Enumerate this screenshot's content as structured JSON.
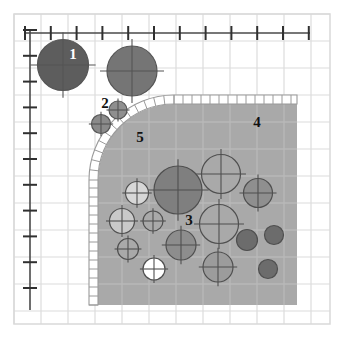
{
  "figure": {
    "name": "grain-packing-diagram",
    "width": 344,
    "height": 338,
    "background_color": "#ffffff"
  },
  "colors": {
    "background": "#ffffff",
    "frame_border": "#d9d9d9",
    "grid_line": "#e8e8e8",
    "grid_line_major": "#dcdcdc",
    "axis_line": "#4a4a4a",
    "tick_mark": "#303030",
    "shaded_region_fill": "#a9a9a9",
    "shaded_region_grid": "#b8b8b8",
    "hatch_band_fill": "#ffffff",
    "hatch_band_stroke": "#9a9a9a",
    "circle_dark": "#5d5d5d",
    "circle_mid_dark": "#7c7c7c",
    "circle_mid": "#8f8f8f",
    "circle_light": "#bdbdbd",
    "circle_pale": "#d7d7d7",
    "circle_white": "#ffffff",
    "circle_stroke": "#555555",
    "label_dark": "#111111",
    "label_light": "#ffffff"
  },
  "frame": {
    "x": 14,
    "y": 14,
    "width": 316,
    "height": 310
  },
  "grid": {
    "cell_size": 27,
    "origin_x": 14,
    "origin_y": 14,
    "visible": true
  },
  "axes": {
    "x_axis": {
      "name": "x-axis",
      "x1": 25,
      "y1": 33,
      "x2": 310,
      "y2": 33,
      "tick_count": 12,
      "tick_spacing": 25.8,
      "tick_length": 7,
      "tick_labels": []
    },
    "y_axis": {
      "name": "y-axis",
      "x1": 30,
      "y1": 30,
      "x2": 30,
      "y2": 310,
      "tick_count": 11,
      "tick_spacing": 25.8,
      "tick_length": 7,
      "tick_labels": []
    }
  },
  "region": {
    "name": "shaded-packed-region",
    "left": 98,
    "top": 104,
    "right": 297,
    "bottom": 305,
    "corner_radius": 76,
    "fill": "#a9a9a9"
  },
  "hatch_band": {
    "name": "hatched-boundary-band",
    "thickness": 9,
    "rung_spacing": 9,
    "description": "ladder-hatched band tracing the top edge and the rounded left corner down the left side"
  },
  "labels": [
    {
      "id": "1",
      "text": "1",
      "x": 73,
      "y": 59,
      "color": "#ffffff",
      "size": 15
    },
    {
      "id": "2",
      "text": "2",
      "x": 105,
      "y": 108,
      "color": "#111111",
      "size": 15
    },
    {
      "id": "3",
      "text": "3",
      "x": 189,
      "y": 225,
      "color": "#111111",
      "size": 15
    },
    {
      "id": "4",
      "text": "4",
      "x": 257,
      "y": 127,
      "color": "#111111",
      "size": 15
    },
    {
      "id": "5",
      "text": "5",
      "x": 140,
      "y": 142,
      "color": "#111111",
      "size": 15
    }
  ],
  "circles": [
    {
      "name": "grain-outside-1",
      "cx": 63,
      "cy": 65,
      "r": 25.5,
      "fill": "#5d5d5d",
      "cross": true,
      "stroke": "#555555"
    },
    {
      "name": "grain-outside-2",
      "cx": 132,
      "cy": 71,
      "r": 25.0,
      "fill": "#757575",
      "cross": true,
      "stroke": "#555555"
    },
    {
      "name": "grain-outside-3",
      "cx": 118,
      "cy": 110,
      "r": 9.0,
      "fill": "#8f8f8f",
      "cross": true,
      "stroke": "#555555"
    },
    {
      "name": "grain-outside-4",
      "cx": 101,
      "cy": 124,
      "r": 9.5,
      "fill": "#8a8a8a",
      "cross": true,
      "stroke": "#555555"
    },
    {
      "name": "grain-inside-1",
      "cx": 178,
      "cy": 190,
      "r": 24.0,
      "fill": "#7f7f7f",
      "cross": true,
      "stroke": "#4f4f4f"
    },
    {
      "name": "grain-inside-2",
      "cx": 221,
      "cy": 174,
      "r": 19.5,
      "fill": "#a9a9a9",
      "cross": true,
      "stroke": "#4f4f4f"
    },
    {
      "name": "grain-inside-3",
      "cx": 258,
      "cy": 193,
      "r": 14.5,
      "fill": "#8f8f8f",
      "cross": true,
      "stroke": "#4f4f4f"
    },
    {
      "name": "grain-inside-4",
      "cx": 219,
      "cy": 224,
      "r": 19.5,
      "fill": "#a9a9a9",
      "cross": true,
      "stroke": "#4f4f4f"
    },
    {
      "name": "grain-inside-5",
      "cx": 137,
      "cy": 193,
      "r": 11.5,
      "fill": "#d7d7d7",
      "cross": true,
      "stroke": "#4f4f4f"
    },
    {
      "name": "grain-inside-6",
      "cx": 122,
      "cy": 221,
      "r": 12.5,
      "fill": "#c9c9c9",
      "cross": true,
      "stroke": "#4f4f4f"
    },
    {
      "name": "grain-inside-7",
      "cx": 153,
      "cy": 221,
      "r": 10.0,
      "fill": "#a9a9a9",
      "cross": true,
      "stroke": "#4f4f4f"
    },
    {
      "name": "grain-inside-8",
      "cx": 128,
      "cy": 249,
      "r": 10.5,
      "fill": "#a9a9a9",
      "cross": true,
      "stroke": "#4f4f4f"
    },
    {
      "name": "grain-inside-9",
      "cx": 181,
      "cy": 245,
      "r": 15.0,
      "fill": "#8d8d8d",
      "cross": true,
      "stroke": "#4f4f4f"
    },
    {
      "name": "grain-inside-10",
      "cx": 154,
      "cy": 269,
      "r": 11.0,
      "fill": "#ffffff",
      "cross": true,
      "stroke": "#4f4f4f"
    },
    {
      "name": "grain-inside-11",
      "cx": 218,
      "cy": 267,
      "r": 15.0,
      "fill": "#9c9c9c",
      "cross": true,
      "stroke": "#4f4f4f"
    },
    {
      "name": "grain-inside-12",
      "cx": 247,
      "cy": 240,
      "r": 10.5,
      "fill": "#6c6c6c",
      "cross": false,
      "stroke": "#4f4f4f"
    },
    {
      "name": "grain-inside-13",
      "cx": 274,
      "cy": 235,
      "r": 9.5,
      "fill": "#6c6c6c",
      "cross": false,
      "stroke": "#4f4f4f"
    },
    {
      "name": "grain-inside-14",
      "cx": 268,
      "cy": 269,
      "r": 9.5,
      "fill": "#6c6c6c",
      "cross": false,
      "stroke": "#4f4f4f"
    }
  ]
}
